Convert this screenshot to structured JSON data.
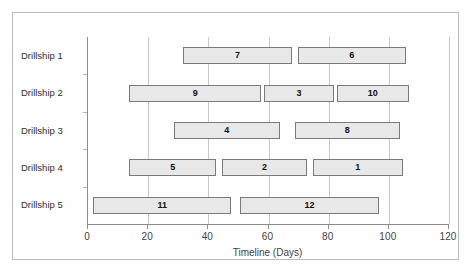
{
  "chart_data": {
    "type": "bar",
    "chart_style": "gantt",
    "title": "",
    "xlabel": "Timeline (Days)",
    "ylabel": "",
    "xlim": [
      0,
      120
    ],
    "xticks": [
      0,
      20,
      40,
      60,
      80,
      100,
      120
    ],
    "xtick_labels": [
      "0",
      "20",
      "40",
      "60",
      "80",
      "100",
      "120"
    ],
    "grid": true,
    "grid_axis": "x",
    "legend": "none",
    "categories": [
      "Drillship 1",
      "Drillship 2",
      "Drillship 3",
      "Drillship 4",
      "Drillship 5"
    ],
    "bar_fill_color": "#e8e8e8",
    "bar_border_color": "#7a7a7a",
    "tasks": [
      {
        "row": "Drillship 1",
        "label": "7",
        "start": 32,
        "end": 68,
        "duration": 36
      },
      {
        "row": "Drillship 1",
        "label": "6",
        "start": 70,
        "end": 106,
        "duration": 36
      },
      {
        "row": "Drillship 2",
        "label": "9",
        "start": 14,
        "end": 58,
        "duration": 44
      },
      {
        "row": "Drillship 2",
        "label": "3",
        "start": 59,
        "end": 82,
        "duration": 23
      },
      {
        "row": "Drillship 2",
        "label": "10",
        "start": 83,
        "end": 107,
        "duration": 24
      },
      {
        "row": "Drillship 3",
        "label": "4",
        "start": 29,
        "end": 64,
        "duration": 35
      },
      {
        "row": "Drillship 3",
        "label": "8",
        "start": 69,
        "end": 104,
        "duration": 35
      },
      {
        "row": "Drillship 4",
        "label": "5",
        "start": 14,
        "end": 43,
        "duration": 29
      },
      {
        "row": "Drillship 4",
        "label": "2",
        "start": 45,
        "end": 73,
        "duration": 28
      },
      {
        "row": "Drillship 4",
        "label": "1",
        "start": 75,
        "end": 105,
        "duration": 30
      },
      {
        "row": "Drillship 5",
        "label": "11",
        "start": 2,
        "end": 48,
        "duration": 46
      },
      {
        "row": "Drillship 5",
        "label": "12",
        "start": 51,
        "end": 97,
        "duration": 46
      }
    ]
  }
}
